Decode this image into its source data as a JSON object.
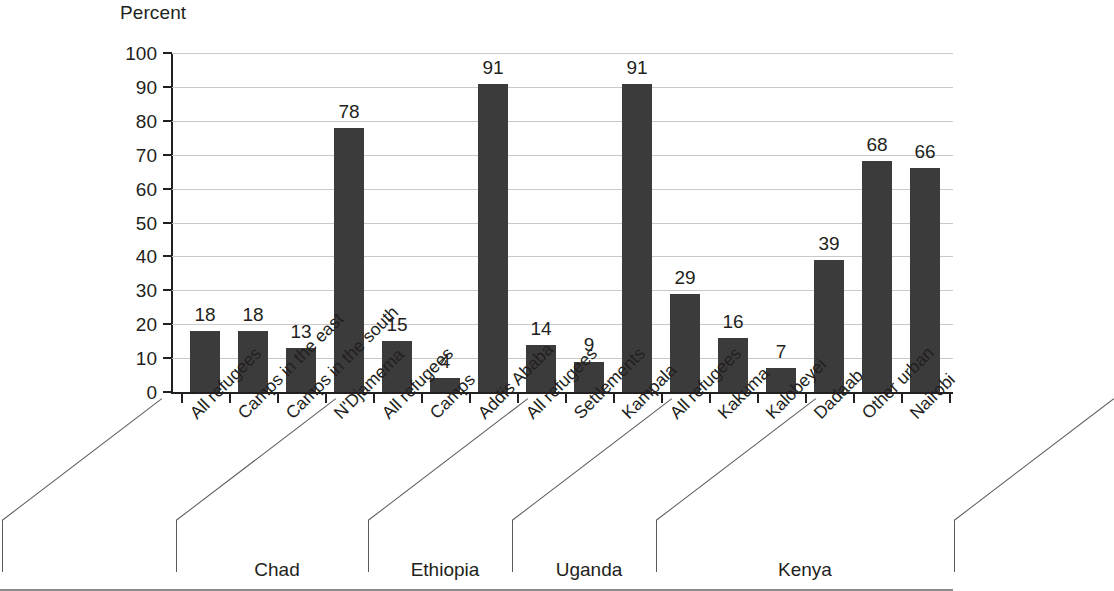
{
  "chart_data": {
    "type": "bar",
    "title": "",
    "ylabel": "Percent",
    "xlabel": "",
    "ylim": [
      0,
      100
    ],
    "ytick_step": 10,
    "ytick_labels": [
      "100",
      "90",
      "80",
      "70",
      "60",
      "50",
      "40",
      "30",
      "20",
      "10",
      "0"
    ],
    "grid": true,
    "legend": null,
    "bar_color": "#3b3b3b",
    "gridline_color": "#c9c9c9",
    "axis_color": "#231f20",
    "categories": [
      "All refugees",
      "Camps in the east",
      "Camps in the south",
      "N'Djamema",
      "All refugees",
      "Camps",
      "Addis Ababa",
      "All refugees",
      "Settlements",
      "Kampala",
      "All refugees",
      "Kakuma",
      "Kalobeyei",
      "Dadaab",
      "Other urban",
      "Nairobi"
    ],
    "values": [
      18,
      18,
      13,
      78,
      15,
      4,
      91,
      14,
      9,
      91,
      29,
      16,
      7,
      39,
      68,
      66
    ],
    "value_labels": [
      "18",
      "18",
      "13",
      "78",
      "15",
      "4",
      "91",
      "14",
      "9",
      "91",
      "29",
      "16",
      "7",
      "39",
      "68",
      "66"
    ],
    "groups": [
      {
        "label": "Chad",
        "count": 4
      },
      {
        "label": "Ethiopia",
        "count": 3
      },
      {
        "label": "Uganda",
        "count": 3
      },
      {
        "label": "Kenya",
        "count": 6
      }
    ]
  }
}
